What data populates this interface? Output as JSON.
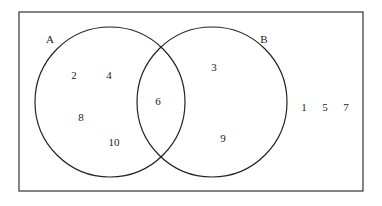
{
  "diagram": {
    "type": "venn",
    "universe": {
      "x": 19,
      "y": 12,
      "w": 344,
      "h": 179
    },
    "sets": [
      {
        "name": "A",
        "cx": 110,
        "cy": 102,
        "r": 75,
        "label_x": 50,
        "label_y": 43
      },
      {
        "name": "B",
        "cx": 212,
        "cy": 102,
        "r": 75,
        "label_x": 264,
        "label_y": 43
      }
    ],
    "elements": [
      {
        "value": "2",
        "x": 74,
        "y": 79,
        "region": "A only"
      },
      {
        "value": "4",
        "x": 109,
        "y": 79,
        "region": "A only"
      },
      {
        "value": "8",
        "x": 81,
        "y": 121,
        "region": "A only"
      },
      {
        "value": "10",
        "x": 114,
        "y": 146,
        "region": "A only"
      },
      {
        "value": "6",
        "x": 158,
        "y": 105,
        "region": "A and B"
      },
      {
        "value": "3",
        "x": 214,
        "y": 71,
        "region": "B only"
      },
      {
        "value": "9",
        "x": 223,
        "y": 142,
        "region": "B only"
      },
      {
        "value": "1",
        "x": 304,
        "y": 111,
        "region": "outside"
      },
      {
        "value": "5",
        "x": 325,
        "y": 111,
        "region": "outside"
      },
      {
        "value": "7",
        "x": 346,
        "y": 111,
        "region": "outside"
      }
    ]
  }
}
